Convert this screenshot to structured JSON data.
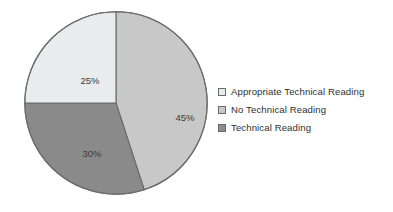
{
  "chart_data": {
    "type": "pie",
    "title": "",
    "subtitle": "",
    "xlabel": "",
    "ylabel": "",
    "grid": false,
    "legend_position": "right",
    "start_angle_deg": 0,
    "direction": "clockwise",
    "categories": [
      "Appropriate Technical Reading",
      "No Technical Reading",
      "Technical Reading"
    ],
    "values": [
      25,
      45,
      30
    ],
    "unit": "%",
    "slices": [
      {
        "label": "No Technical Reading",
        "value": 45,
        "data_label": "45%",
        "color": "#c8c8c8",
        "start_deg": 0,
        "end_deg": 162,
        "label_x": 161,
        "label_y": 107
      },
      {
        "label": "Technical Reading",
        "value": 30,
        "data_label": "30%",
        "color": "#8a8a8a",
        "start_deg": 162,
        "end_deg": 270,
        "label_x": 68,
        "label_y": 143
      },
      {
        "label": "Appropriate Technical Reading",
        "value": 25,
        "data_label": "25%",
        "color": "#e9ecec",
        "start_deg": 270,
        "end_deg": 360,
        "label_x": 66,
        "label_y": 70
      }
    ],
    "legend": [
      {
        "label": "Appropriate Technical Reading",
        "color": "#e9ecec"
      },
      {
        "label": "No Technical Reading",
        "color": "#c8c8c8"
      },
      {
        "label": "Technical Reading",
        "color": "#8a8a8a"
      }
    ],
    "colors": {
      "background": "#ffffff",
      "outline": "#6b6b6b",
      "text": "#2f2f2f",
      "label_text": "#3a3a3a"
    }
  }
}
